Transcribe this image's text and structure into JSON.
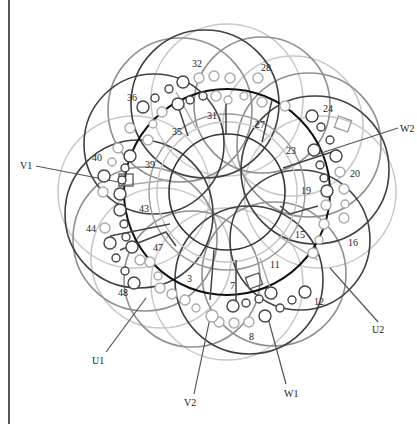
{
  "diagram": {
    "type": "stator-winding-diagram",
    "center": [
      227,
      192
    ],
    "slot_labels": [
      {
        "text": "3",
        "x": 187,
        "y": 282
      },
      {
        "text": "7",
        "x": 233,
        "y": 288
      },
      {
        "text": "11",
        "x": 274,
        "y": 268
      },
      {
        "text": "15",
        "x": 298,
        "y": 237
      },
      {
        "text": "19",
        "x": 304,
        "y": 194
      },
      {
        "text": "23",
        "x": 289,
        "y": 153
      },
      {
        "text": "27",
        "x": 259,
        "y": 127
      },
      {
        "text": "31",
        "x": 211,
        "y": 118
      },
      {
        "text": "35",
        "x": 176,
        "y": 134
      },
      {
        "text": "39",
        "x": 149,
        "y": 166
      },
      {
        "text": "43",
        "x": 143,
        "y": 211
      },
      {
        "text": "47",
        "x": 157,
        "y": 250
      }
    ],
    "outer_labels": [
      {
        "text": "8",
        "x": 251,
        "y": 339
      },
      {
        "text": "12",
        "x": 318,
        "y": 304
      },
      {
        "text": "16",
        "x": 352,
        "y": 245
      },
      {
        "text": "20",
        "x": 354,
        "y": 176
      },
      {
        "text": "24",
        "x": 327,
        "y": 111
      },
      {
        "text": "28",
        "x": 265,
        "y": 70
      },
      {
        "text": "32",
        "x": 196,
        "y": 66
      },
      {
        "text": "36",
        "x": 131,
        "y": 100
      },
      {
        "text": "40",
        "x": 96,
        "y": 160
      },
      {
        "text": "44",
        "x": 90,
        "y": 231
      },
      {
        "text": "48",
        "x": 122,
        "y": 295
      }
    ],
    "terminals": [
      {
        "text": "V1",
        "x": 22,
        "y": 168
      },
      {
        "text": "W2",
        "x": 402,
        "y": 130
      },
      {
        "text": "U1",
        "x": 98,
        "y": 362
      },
      {
        "text": "V2",
        "x": 190,
        "y": 404
      },
      {
        "text": "W1",
        "x": 290,
        "y": 395
      },
      {
        "text": "U2",
        "x": 378,
        "y": 331
      }
    ],
    "colors": {
      "phase_dark": "#3a3a3a",
      "phase_mid": "#8a8a8a",
      "phase_light": "#c4c4c4",
      "ring": "#111111"
    }
  }
}
